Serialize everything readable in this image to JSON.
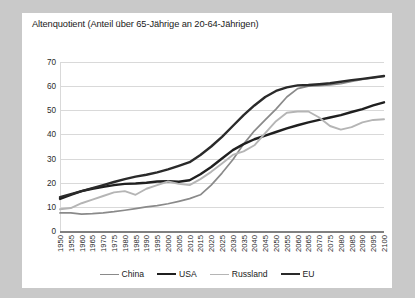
{
  "chart_data": {
    "type": "line",
    "title": "Altenquotient (Anteil über 65-Jährige an 20-64-Jährigen)",
    "xlabel": "",
    "ylabel": "",
    "ylim": [
      0,
      70
    ],
    "ytick_step": 10,
    "yticks": [
      "0",
      "10",
      "20",
      "30",
      "40",
      "50",
      "60",
      "70"
    ],
    "grid": true,
    "legend_position": "bottom",
    "x": [
      1950,
      1955,
      1960,
      1965,
      1970,
      1975,
      1980,
      1985,
      1990,
      1995,
      2000,
      2005,
      2010,
      2015,
      2020,
      2025,
      2030,
      2035,
      2040,
      2045,
      2050,
      2055,
      2060,
      2065,
      2070,
      2075,
      2080,
      2085,
      2090,
      2095,
      2100
    ],
    "categories": [
      "1950",
      "1955",
      "1960",
      "1965",
      "1970",
      "1975",
      "1980",
      "1985",
      "1990",
      "1995",
      "2000",
      "2005",
      "2010",
      "2015",
      "2020",
      "2025",
      "2030",
      "2035",
      "2040",
      "2045",
      "2050",
      "2055",
      "2060",
      "2065",
      "2070",
      "2075",
      "2080",
      "2085",
      "2090",
      "2095",
      "2100"
    ],
    "series": [
      {
        "name": "China",
        "color": "#8a8a8a",
        "width": 1.7,
        "values": [
          7.5,
          7.5,
          7.0,
          7.2,
          7.5,
          8.0,
          8.6,
          9.3,
          10.0,
          10.5,
          11.3,
          12.3,
          13.4,
          15.0,
          19.0,
          24.0,
          29.5,
          36.0,
          41.5,
          46.0,
          50.5,
          55.5,
          59.0,
          60.0,
          60.2,
          60.5,
          61.0,
          62.0,
          62.8,
          63.5,
          64.0
        ]
      },
      {
        "name": "USA",
        "color": "#1f1f1f",
        "width": 2.4,
        "values": [
          13.3,
          15.0,
          16.5,
          17.5,
          18.3,
          19.0,
          19.5,
          19.7,
          20.0,
          20.5,
          20.6,
          20.4,
          21.0,
          23.5,
          26.5,
          30.0,
          33.5,
          36.0,
          38.0,
          39.5,
          41.0,
          42.5,
          43.8,
          45.0,
          46.0,
          47.0,
          48.0,
          49.3,
          50.5,
          52.0,
          53.3
        ]
      },
      {
        "name": "Russland",
        "color": "#b5b5b5",
        "width": 1.9,
        "values": [
          9.0,
          9.5,
          11.5,
          13.0,
          14.5,
          16.0,
          16.5,
          15.0,
          17.5,
          19.0,
          20.5,
          19.5,
          19.0,
          21.5,
          24.5,
          28.0,
          31.5,
          33.0,
          35.5,
          40.5,
          45.5,
          49.0,
          49.5,
          49.5,
          47.0,
          43.5,
          42.0,
          43.0,
          45.0,
          46.0,
          46.3
        ]
      },
      {
        "name": "EU",
        "color": "#2a2a2a",
        "width": 2.4,
        "values": [
          14.0,
          15.3,
          16.5,
          17.8,
          19.0,
          20.3,
          21.5,
          22.5,
          23.3,
          24.3,
          25.5,
          27.0,
          28.5,
          31.5,
          35.0,
          39.0,
          43.5,
          48.0,
          52.0,
          55.5,
          58.0,
          59.5,
          60.3,
          60.5,
          60.8,
          61.2,
          61.8,
          62.5,
          63.0,
          63.6,
          64.2
        ]
      }
    ]
  }
}
